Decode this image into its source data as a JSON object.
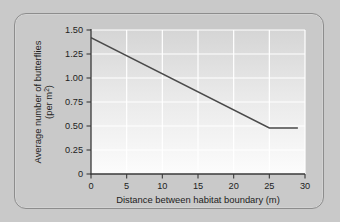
{
  "chart_data": {
    "type": "line",
    "title": "",
    "xlabel": "Distance between habitat boundary (m)",
    "ylabel_line1": "Average number of butterflies",
    "ylabel_line2": "(per m",
    "ylabel_sup": "2",
    "ylabel_line2_end": ")",
    "ylabel_full": "Average number of butterflies (per m2)",
    "xlim": [
      0,
      30
    ],
    "ylim": [
      0,
      1.5
    ],
    "xticks": [
      0,
      5,
      10,
      15,
      20,
      25,
      30
    ],
    "xtick_labels": [
      "0",
      "5",
      "10",
      "15",
      "20",
      "25",
      "30"
    ],
    "yticks": [
      0,
      0.25,
      0.5,
      0.75,
      1.0,
      1.25,
      1.5
    ],
    "ytick_labels": [
      "0",
      "0.25",
      "0.50",
      "0.75",
      "1.00",
      "1.25",
      "1.50"
    ],
    "grid": true,
    "grid_color": "#ffffff",
    "legend": null,
    "line_color": "#4a4a4a",
    "series": [
      {
        "name": "Average butterflies per square metre",
        "x": [
          0,
          25,
          29
        ],
        "values": [
          1.42,
          0.48,
          0.48
        ]
      }
    ],
    "annotations": []
  },
  "figure": {
    "card_background": "#c9c9c9",
    "card_border_color": "#8d8d8d",
    "plot_background_top": "#d4d4d4",
    "plot_background_bottom": "#fbfbfb"
  }
}
